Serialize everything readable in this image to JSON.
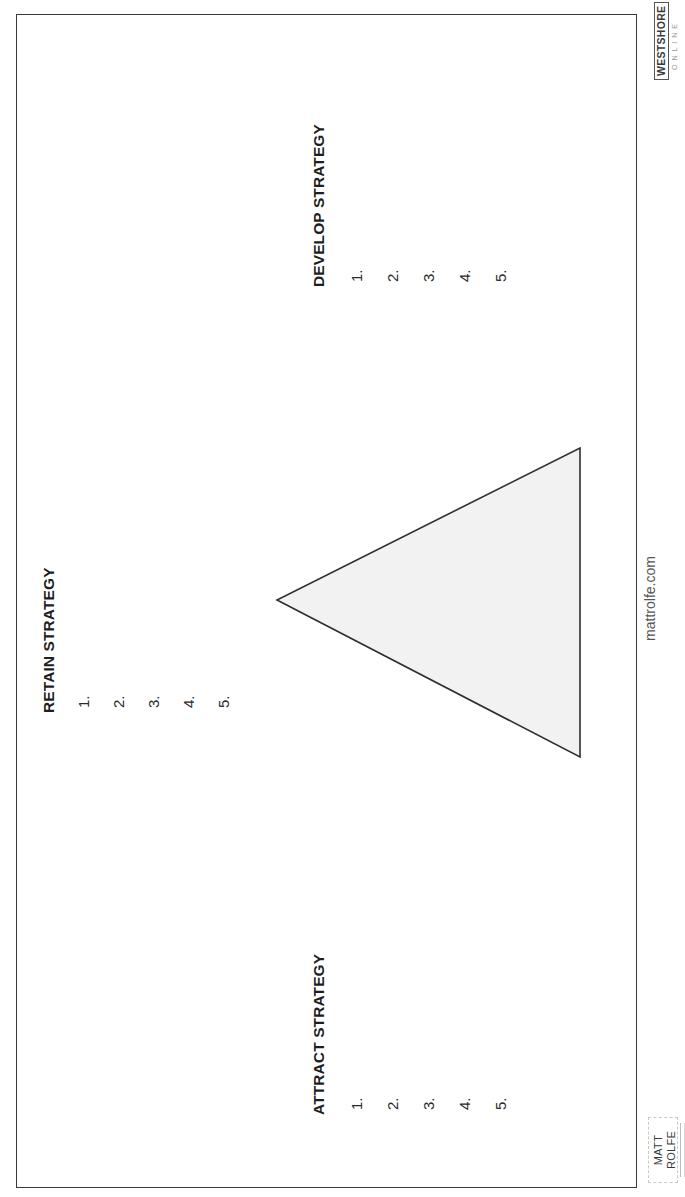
{
  "document": {
    "orientation": "rotated 90deg counter-clockwise",
    "diagram": {
      "shape": "triangle",
      "fill": "#f2f2f2",
      "stroke": "#2f2f2f"
    },
    "sections": {
      "retain": {
        "heading": "RETAIN STRATEGY",
        "items": [
          "1.",
          "2.",
          "3.",
          "4.",
          "5."
        ]
      },
      "develop": {
        "heading": "DEVELOP STRATEGY",
        "items": [
          "1.",
          "2.",
          "3.",
          "4.",
          "5."
        ]
      },
      "attract": {
        "heading": "ATTRACT STRATEGY",
        "items": [
          "1.",
          "2.",
          "3.",
          "4.",
          "5."
        ]
      }
    },
    "footer": {
      "url": "mattrolfe.com",
      "logo_left": "MATT ROLFE",
      "logo_right": "WESTSHORE",
      "logo_right_sub": "ONLINE"
    }
  }
}
